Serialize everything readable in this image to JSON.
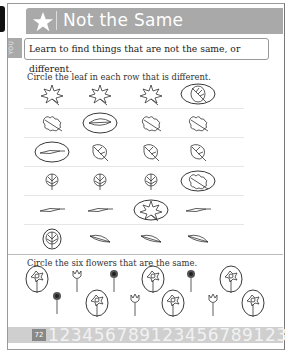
{
  "header": {
    "title": "Not the Same",
    "icon": "star-icon"
  },
  "side_tab": {
    "label": "YOU"
  },
  "intro": {
    "text": "Learn to find things that are not the same, or different."
  },
  "section1": {
    "instruction": "Circle the leaf in each row that is different.",
    "rows": [
      {
        "items": [
          "maple-leaf",
          "maple-leaf",
          "maple-leaf",
          "round-leaf"
        ],
        "circled": 3
      },
      {
        "items": [
          "oak-leaf",
          "long-leaf",
          "oak-leaf",
          "oak-leaf"
        ],
        "circled": 1
      },
      {
        "items": [
          "thin-leaf",
          "heart-leaf",
          "heart-leaf",
          "heart-leaf"
        ],
        "circled": 0
      },
      {
        "items": [
          "fan-leaf",
          "fan-leaf",
          "fan-leaf",
          "oak-leaf"
        ],
        "circled": 3
      },
      {
        "items": [
          "thin-leaf",
          "thin-leaf",
          "maple-leaf",
          "thin-leaf"
        ],
        "circled": 2
      },
      {
        "items": [
          "fan-leaf",
          "willow-leaf",
          "willow-leaf",
          "willow-leaf"
        ],
        "circled": 0
      }
    ]
  },
  "section2": {
    "instruction": "Circle the six flowers that are the same.",
    "flowers": [
      {
        "type": "daffodil",
        "circled": true
      },
      {
        "type": "tulip",
        "circled": false
      },
      {
        "type": "daisy",
        "circled": false
      },
      {
        "type": "daffodil",
        "circled": true
      },
      {
        "type": "daisy",
        "circled": false
      },
      {
        "type": "daffodil",
        "circled": true
      },
      {
        "type": "daisy",
        "circled": false
      },
      {
        "type": "daffodil",
        "circled": true
      },
      {
        "type": "tulip",
        "circled": false
      },
      {
        "type": "daffodil",
        "circled": true
      },
      {
        "type": "tulip",
        "circled": false
      },
      {
        "type": "daffodil",
        "circled": true
      }
    ]
  },
  "footer": {
    "page_number": "72",
    "digits": "123456789123456789123"
  }
}
